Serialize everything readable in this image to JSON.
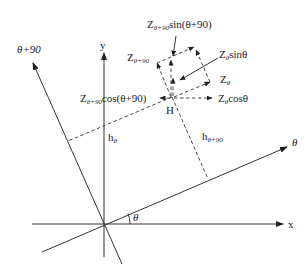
{
  "diagram": {
    "title": "",
    "axes": {
      "x": {
        "label": "x"
      },
      "y": {
        "label": "y"
      },
      "theta": {
        "label": "θ"
      },
      "theta_plus_90": {
        "label": "θ+90"
      },
      "angle": {
        "label": "θ"
      }
    },
    "point": {
      "label": "H"
    },
    "distances": {
      "h_theta": {
        "base": "h",
        "sub": "θ"
      },
      "h_theta_plus_90": {
        "base": "h",
        "sub": "θ+90"
      }
    },
    "components": {
      "z_theta_90_sin": {
        "base": "Z",
        "sub": "θ+90",
        "expr": "sin(θ+90)"
      },
      "z_theta_sin": {
        "base": "Z",
        "sub": "θ",
        "expr": "sinθ"
      },
      "z_theta_90": {
        "base": "Z",
        "sub": "θ+90",
        "expr": ""
      },
      "z_theta": {
        "base": "Z",
        "sub": "θ",
        "expr": ""
      },
      "z_theta_90_cos": {
        "base": "Z",
        "sub": "θ+90",
        "expr": "cos(θ+90)"
      },
      "z_theta_cos": {
        "base": "Z",
        "sub": "θ",
        "expr": "cosθ"
      }
    },
    "colors": {
      "line": "#333333",
      "text": "#222222",
      "background": "#ffffff"
    }
  }
}
